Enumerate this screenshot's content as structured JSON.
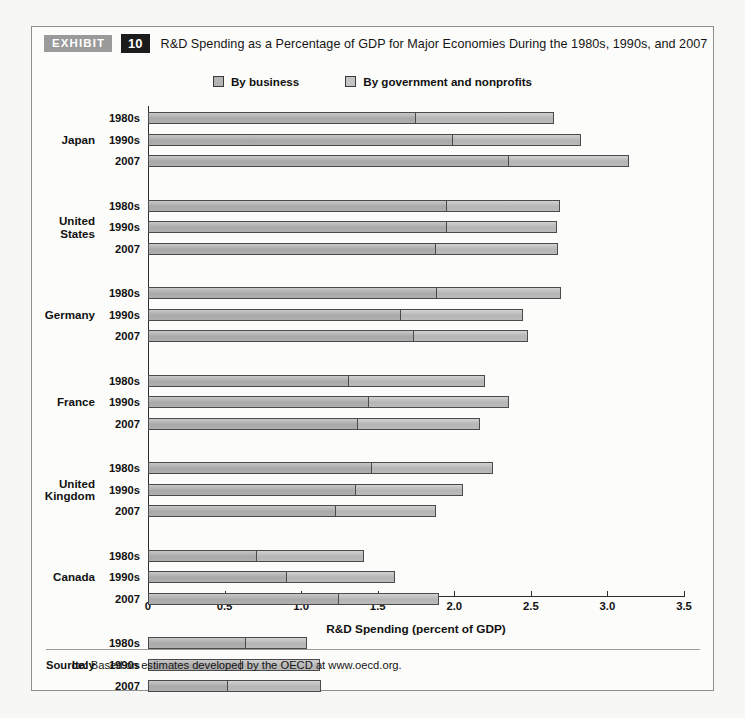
{
  "exhibit": {
    "badge_label": "EXHIBIT",
    "number": "10",
    "title": "R&D Spending as a Percentage of GDP for Major Economies During the 1980s, 1990s, and 2007"
  },
  "source": {
    "prefix": "Source:",
    "text": " Based on estimates developed by the OECD at www.oecd.org."
  },
  "colors": {
    "business": "#b2b2b2",
    "government": "#bfbfbf",
    "bar_border": "#4a4a4a",
    "badge_exhibit_bg": "#9a9a9a",
    "badge_number_bg": "#1b1b1b",
    "axis": "#2d2d2d"
  },
  "chart_data": {
    "type": "bar",
    "orientation": "horizontal",
    "stacked": true,
    "title": "R&D Spending as a Percentage of GDP for Major Economies During the 1980s, 1990s, and 2007",
    "xlabel": "R&D Spending (percent of GDP)",
    "ylabel": "",
    "xlim": [
      0,
      3.5
    ],
    "xticks": [
      0,
      0.5,
      1.0,
      1.5,
      2.0,
      2.5,
      3.0,
      3.5
    ],
    "xtick_labels": [
      "0",
      "0.5",
      "1.0",
      "1.5",
      "2.0",
      "2.5",
      "3.0",
      "3.5"
    ],
    "grid": false,
    "legend_position": "top-center",
    "series": [
      {
        "name": "By business",
        "color": "#b2b2b2"
      },
      {
        "name": "By government and nonprofits",
        "color": "#bfbfbf"
      }
    ],
    "groups": [
      {
        "country": "Japan",
        "rows": [
          {
            "period": "1980s",
            "business": 1.75,
            "government": 0.9,
            "total": 2.65
          },
          {
            "period": "1990s",
            "business": 1.99,
            "government": 0.84,
            "total": 2.83
          },
          {
            "period": "2007",
            "business": 2.36,
            "government": 0.78,
            "total": 3.14
          }
        ]
      },
      {
        "country": "United States",
        "rows": [
          {
            "period": "1980s",
            "business": 1.95,
            "government": 0.74,
            "total": 2.69
          },
          {
            "period": "1990s",
            "business": 1.95,
            "government": 0.72,
            "total": 2.67
          },
          {
            "period": "2007",
            "business": 1.88,
            "government": 0.8,
            "total": 2.68
          }
        ]
      },
      {
        "country": "Germany",
        "rows": [
          {
            "period": "1980s",
            "business": 1.89,
            "government": 0.81,
            "total": 2.7
          },
          {
            "period": "1990s",
            "business": 1.65,
            "government": 0.8,
            "total": 2.45
          },
          {
            "period": "2007",
            "business": 1.74,
            "government": 0.74,
            "total": 2.48
          }
        ]
      },
      {
        "country": "France",
        "rows": [
          {
            "period": "1980s",
            "business": 1.31,
            "government": 0.89,
            "total": 2.2
          },
          {
            "period": "1990s",
            "business": 1.44,
            "government": 0.92,
            "total": 2.36
          },
          {
            "period": "2007",
            "business": 1.37,
            "government": 0.8,
            "total": 2.17
          }
        ]
      },
      {
        "country": "United Kingdom",
        "rows": [
          {
            "period": "1980s",
            "business": 1.46,
            "government": 0.79,
            "total": 2.25
          },
          {
            "period": "1990s",
            "business": 1.36,
            "government": 0.7,
            "total": 2.06
          },
          {
            "period": "2007",
            "business": 1.23,
            "government": 0.65,
            "total": 1.88
          }
        ]
      },
      {
        "country": "Canada",
        "rows": [
          {
            "period": "1980s",
            "business": 0.71,
            "government": 0.7,
            "total": 1.41
          },
          {
            "period": "1990s",
            "business": 0.91,
            "government": 0.7,
            "total": 1.61
          },
          {
            "period": "2007",
            "business": 1.25,
            "government": 0.65,
            "total": 1.9
          }
        ]
      },
      {
        "country": "Italy",
        "rows": [
          {
            "period": "1980s",
            "business": 0.64,
            "government": 0.4,
            "total": 1.04
          },
          {
            "period": "1990s",
            "business": 0.61,
            "government": 0.51,
            "total": 1.12
          },
          {
            "period": "2007",
            "business": 0.52,
            "government": 0.61,
            "total": 1.13
          }
        ]
      }
    ]
  }
}
